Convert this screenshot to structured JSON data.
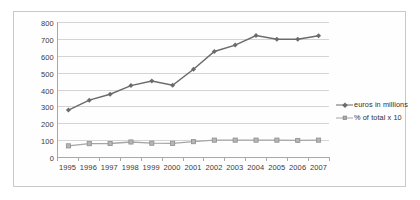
{
  "chart_data": {
    "type": "line",
    "title": "",
    "subtitle": "",
    "xlabel": "",
    "ylabel": "",
    "categories": [
      "1995",
      "1996",
      "1997",
      "1998",
      "1999",
      "2000",
      "2001",
      "2002",
      "2003",
      "2004",
      "2005",
      "2006",
      "2007"
    ],
    "yticks": [
      0,
      100,
      200,
      300,
      400,
      500,
      600,
      700,
      800
    ],
    "ytick_labels": [
      "0",
      "100",
      "200",
      "300",
      "400",
      "500",
      "600",
      "700",
      "800"
    ],
    "ylim": [
      0,
      800
    ],
    "grid": true,
    "legend_position": "right",
    "series": [
      {
        "name": "euros in millions",
        "color": "#6b6b6b",
        "marker": "diamond",
        "values": [
          278,
          337,
          372,
          423,
          450,
          425,
          520,
          625,
          663,
          720,
          698,
          698,
          718
        ]
      },
      {
        "name": "% of total x 10",
        "color": "#a6a6a6",
        "marker": "square",
        "values": [
          66,
          79,
          80,
          89,
          82,
          81,
          91,
          100,
          100,
          100,
          100,
          98,
          100
        ]
      }
    ]
  },
  "legend": {
    "items": [
      {
        "label": "euros in millions"
      },
      {
        "label": "% of total x 10"
      }
    ]
  },
  "colors": {
    "series1": "#6b6b6b",
    "series2": "#a6a6a6",
    "grid": "#d4d4d4",
    "axis": "#a8a8a8",
    "frame": "#c9c9c9",
    "text": "#3a3a3a"
  }
}
